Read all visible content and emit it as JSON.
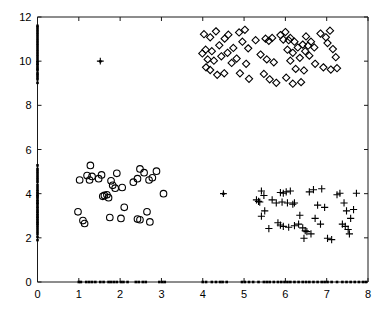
{
  "chart_data": {
    "type": "scatter",
    "title": "",
    "xlabel": "",
    "ylabel": "",
    "xlim": [
      0,
      8
    ],
    "ylim": [
      0,
      12
    ],
    "xticks": [
      0,
      1,
      2,
      3,
      4,
      5,
      6,
      7,
      8
    ],
    "yticks": [
      0,
      2,
      4,
      6,
      8,
      10,
      12
    ],
    "xtick_labels": [
      "0",
      "1",
      "2",
      "3",
      "4",
      "5",
      "6",
      "7",
      "8"
    ],
    "ytick_labels": [
      "0",
      "2",
      "4",
      "6",
      "8",
      "10",
      "12"
    ],
    "grid": false,
    "legend": null,
    "frame": "box",
    "colors": {
      "marker": "#000000",
      "axis": "#1a1a1a",
      "background": "#ffffff"
    },
    "series": [
      {
        "name": "diamonds",
        "marker": "diamond",
        "filled": false,
        "points": [
          [
            4.03,
            11.22
          ],
          [
            4.18,
            11.08
          ],
          [
            4.32,
            11.35
          ],
          [
            4.07,
            10.52
          ],
          [
            4.22,
            10.45
          ],
          [
            4.4,
            10.72
          ],
          [
            4.53,
            11.02
          ],
          [
            4.12,
            10.08
          ],
          [
            3.99,
            10.35
          ],
          [
            4.27,
            10.02
          ],
          [
            4.45,
            10.22
          ],
          [
            4.6,
            10.38
          ],
          [
            4.18,
            9.6
          ],
          [
            4.35,
            9.38
          ],
          [
            4.08,
            9.72
          ],
          [
            4.52,
            9.45
          ],
          [
            4.74,
            10.6
          ],
          [
            4.7,
            9.92
          ],
          [
            4.88,
            11.3
          ],
          [
            5.02,
            11.42
          ],
          [
            4.96,
            10.88
          ],
          [
            5.1,
            10.58
          ],
          [
            4.82,
            10.12
          ],
          [
            5.05,
            9.88
          ],
          [
            4.9,
            9.45
          ],
          [
            5.12,
            9.2
          ],
          [
            4.62,
            11.2
          ],
          [
            5.28,
            10.95
          ],
          [
            5.4,
            10.3
          ],
          [
            5.52,
            11.02
          ],
          [
            5.6,
            10.92
          ],
          [
            5.68,
            11.05
          ],
          [
            5.55,
            10.08
          ],
          [
            5.72,
            9.95
          ],
          [
            5.48,
            9.42
          ],
          [
            5.62,
            9.18
          ],
          [
            5.78,
            9.02
          ],
          [
            5.88,
            11.18
          ],
          [
            6.0,
            11.32
          ],
          [
            6.12,
            11.05
          ],
          [
            6.22,
            10.88
          ],
          [
            6.05,
            10.52
          ],
          [
            6.18,
            10.38
          ],
          [
            6.3,
            10.62
          ],
          [
            6.42,
            10.75
          ],
          [
            6.35,
            10.15
          ],
          [
            6.12,
            10.02
          ],
          [
            6.25,
            9.65
          ],
          [
            6.02,
            9.25
          ],
          [
            6.18,
            8.98
          ],
          [
            6.38,
            9.05
          ],
          [
            6.48,
            10.45
          ],
          [
            6.55,
            10.7
          ],
          [
            6.62,
            10.88
          ],
          [
            6.7,
            10.62
          ],
          [
            6.58,
            10.25
          ],
          [
            6.72,
            9.88
          ],
          [
            6.45,
            9.58
          ],
          [
            6.85,
            11.25
          ],
          [
            6.98,
            11.08
          ],
          [
            7.08,
            11.38
          ],
          [
            7.02,
            10.82
          ],
          [
            7.15,
            10.55
          ],
          [
            7.22,
            10.18
          ],
          [
            6.92,
            9.72
          ],
          [
            7.1,
            9.62
          ],
          [
            7.25,
            9.68
          ],
          [
            5.95,
            10.98
          ],
          [
            6.08,
            10.95
          ],
          [
            6.5,
            11.12
          ]
        ]
      },
      {
        "name": "circles",
        "marker": "circle",
        "filled": false,
        "points": [
          [
            1.02,
            4.62
          ],
          [
            1.28,
            5.28
          ],
          [
            1.2,
            4.82
          ],
          [
            1.32,
            4.78
          ],
          [
            1.26,
            4.62
          ],
          [
            0.98,
            3.18
          ],
          [
            1.1,
            2.78
          ],
          [
            1.14,
            2.65
          ],
          [
            1.58,
            3.88
          ],
          [
            1.62,
            3.92
          ],
          [
            1.68,
            3.95
          ],
          [
            1.72,
            3.82
          ],
          [
            1.55,
            4.85
          ],
          [
            1.78,
            4.58
          ],
          [
            1.82,
            4.38
          ],
          [
            1.88,
            4.25
          ],
          [
            1.92,
            4.92
          ],
          [
            2.05,
            4.28
          ],
          [
            1.75,
            2.92
          ],
          [
            2.02,
            2.88
          ],
          [
            2.1,
            3.38
          ],
          [
            2.32,
            4.52
          ],
          [
            2.42,
            4.68
          ],
          [
            2.48,
            5.12
          ],
          [
            2.58,
            4.95
          ],
          [
            2.42,
            2.85
          ],
          [
            2.48,
            2.82
          ],
          [
            2.7,
            4.62
          ],
          [
            2.78,
            4.72
          ],
          [
            2.88,
            5.02
          ],
          [
            2.65,
            3.18
          ],
          [
            2.72,
            2.72
          ],
          [
            3.05,
            4.0
          ],
          [
            1.48,
            4.68
          ]
        ]
      },
      {
        "name": "plus",
        "marker": "plus",
        "filled": false,
        "points": [
          [
            5.42,
            4.12
          ],
          [
            5.48,
            3.92
          ],
          [
            5.38,
            3.62
          ],
          [
            5.3,
            3.72
          ],
          [
            5.35,
            3.65
          ],
          [
            5.5,
            3.22
          ],
          [
            5.42,
            2.98
          ],
          [
            5.68,
            3.72
          ],
          [
            5.78,
            3.58
          ],
          [
            5.92,
            3.62
          ],
          [
            5.88,
            4.05
          ],
          [
            5.95,
            4.02
          ],
          [
            6.02,
            4.08
          ],
          [
            6.12,
            4.12
          ],
          [
            6.05,
            3.58
          ],
          [
            6.18,
            3.52
          ],
          [
            5.82,
            2.68
          ],
          [
            5.88,
            2.58
          ],
          [
            5.95,
            2.52
          ],
          [
            6.08,
            2.48
          ],
          [
            6.22,
            2.55
          ],
          [
            6.32,
            2.62
          ],
          [
            6.42,
            2.45
          ],
          [
            6.48,
            2.32
          ],
          [
            6.52,
            2.28
          ],
          [
            6.45,
            1.98
          ],
          [
            6.35,
            3.02
          ],
          [
            6.58,
            4.08
          ],
          [
            6.68,
            4.18
          ],
          [
            6.78,
            3.48
          ],
          [
            6.88,
            4.22
          ],
          [
            6.95,
            3.38
          ],
          [
            6.72,
            2.88
          ],
          [
            6.85,
            2.62
          ],
          [
            7.02,
            1.98
          ],
          [
            7.12,
            1.92
          ],
          [
            7.25,
            3.95
          ],
          [
            7.32,
            4.02
          ],
          [
            7.42,
            3.58
          ],
          [
            7.48,
            3.22
          ],
          [
            7.38,
            2.62
          ],
          [
            7.45,
            2.52
          ],
          [
            7.52,
            2.38
          ],
          [
            7.58,
            2.88
          ],
          [
            7.65,
            3.28
          ],
          [
            7.72,
            4.02
          ],
          [
            7.55,
            2.18
          ],
          [
            6.62,
            2.18
          ],
          [
            6.22,
            3.58
          ],
          [
            5.6,
            2.42
          ]
        ]
      },
      {
        "name": "isolated",
        "marker": "solid-plus",
        "filled": true,
        "points": [
          [
            1.52,
            10.0
          ],
          [
            4.5,
            4.0
          ]
        ]
      },
      {
        "name": "y-axis-projection",
        "marker": "dot",
        "filled": true,
        "axis": "x=0",
        "points": [
          [
            0,
            1.9
          ],
          [
            0,
            2.05
          ],
          [
            0,
            2.18
          ],
          [
            0,
            2.28
          ],
          [
            0,
            2.38
          ],
          [
            0,
            2.48
          ],
          [
            0,
            2.58
          ],
          [
            0,
            2.65
          ],
          [
            0,
            2.72
          ],
          [
            0,
            2.8
          ],
          [
            0,
            2.88
          ],
          [
            0,
            2.95
          ],
          [
            0,
            3.02
          ],
          [
            0,
            3.1
          ],
          [
            0,
            3.18
          ],
          [
            0,
            3.25
          ],
          [
            0,
            3.35
          ],
          [
            0,
            3.42
          ],
          [
            0,
            3.52
          ],
          [
            0,
            3.58
          ],
          [
            0,
            3.65
          ],
          [
            0,
            3.72
          ],
          [
            0,
            3.82
          ],
          [
            0,
            3.88
          ],
          [
            0,
            3.95
          ],
          [
            0,
            4.02
          ],
          [
            0,
            4.1
          ],
          [
            0,
            4.18
          ],
          [
            0,
            4.28
          ],
          [
            0,
            4.38
          ],
          [
            0,
            4.52
          ],
          [
            0,
            4.62
          ],
          [
            0,
            4.72
          ],
          [
            0,
            4.82
          ],
          [
            0,
            4.92
          ],
          [
            0,
            5.02
          ],
          [
            0,
            5.12
          ],
          [
            0,
            5.28
          ],
          [
            0,
            9.02
          ],
          [
            0,
            9.18
          ],
          [
            0,
            9.28
          ],
          [
            0,
            9.38
          ],
          [
            0,
            9.45
          ],
          [
            0,
            9.58
          ],
          [
            0,
            9.65
          ],
          [
            0,
            9.72
          ],
          [
            0,
            9.82
          ],
          [
            0,
            9.88
          ],
          [
            0,
            9.95
          ],
          [
            0,
            10.02
          ],
          [
            0,
            10.12
          ],
          [
            0,
            10.22
          ],
          [
            0,
            10.32
          ],
          [
            0,
            10.42
          ],
          [
            0,
            10.52
          ],
          [
            0,
            10.62
          ],
          [
            0,
            10.72
          ],
          [
            0,
            10.82
          ],
          [
            0,
            10.92
          ],
          [
            0,
            11.02
          ],
          [
            0,
            11.12
          ],
          [
            0,
            11.22
          ],
          [
            0,
            11.32
          ],
          [
            0,
            11.42
          ],
          [
            0,
            11.52
          ],
          [
            0,
            11.6
          ]
        ]
      },
      {
        "name": "x-axis-projection",
        "marker": "dot",
        "filled": true,
        "axis": "y=0",
        "points": [
          [
            1.0,
            0
          ],
          [
            1.05,
            0
          ],
          [
            1.18,
            0
          ],
          [
            1.25,
            0
          ],
          [
            1.32,
            0
          ],
          [
            1.4,
            0
          ],
          [
            1.52,
            0
          ],
          [
            1.6,
            0
          ],
          [
            1.72,
            0
          ],
          [
            1.78,
            0
          ],
          [
            1.85,
            0
          ],
          [
            1.92,
            0
          ],
          [
            2.02,
            0
          ],
          [
            2.08,
            0
          ],
          [
            2.18,
            0
          ],
          [
            2.38,
            0
          ],
          [
            2.45,
            0
          ],
          [
            2.55,
            0
          ],
          [
            2.62,
            0
          ],
          [
            2.95,
            0
          ],
          [
            3.02,
            0
          ],
          [
            3.08,
            0
          ],
          [
            4.0,
            0
          ],
          [
            4.08,
            0
          ],
          [
            4.22,
            0
          ],
          [
            4.32,
            0
          ],
          [
            4.42,
            0
          ],
          [
            4.58,
            0
          ],
          [
            4.95,
            0
          ],
          [
            5.02,
            0
          ],
          [
            5.12,
            0
          ],
          [
            5.22,
            0
          ],
          [
            5.48,
            0
          ],
          [
            5.55,
            0
          ],
          [
            5.62,
            0
          ],
          [
            5.72,
            0
          ],
          [
            5.82,
            0
          ],
          [
            5.9,
            0
          ],
          [
            5.98,
            0
          ],
          [
            6.05,
            0
          ],
          [
            6.12,
            0
          ],
          [
            6.22,
            0
          ],
          [
            6.32,
            0
          ],
          [
            6.42,
            0
          ],
          [
            6.5,
            0
          ],
          [
            6.58,
            0
          ],
          [
            6.68,
            0
          ],
          [
            6.78,
            0
          ],
          [
            6.88,
            0
          ],
          [
            6.95,
            0
          ],
          [
            7.02,
            0
          ],
          [
            7.12,
            0
          ],
          [
            7.25,
            0
          ],
          [
            7.38,
            0
          ],
          [
            7.48,
            0
          ],
          [
            7.58,
            0
          ],
          [
            7.68,
            0
          ],
          [
            7.78,
            0
          ],
          [
            7.88,
            0
          ],
          [
            7.95,
            0
          ],
          [
            5.35,
            0
          ],
          [
            4.48,
            0
          ]
        ]
      }
    ]
  }
}
